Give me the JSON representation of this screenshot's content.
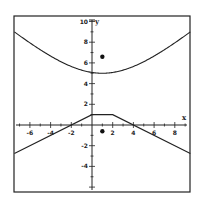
{
  "chart_data": {
    "type": "line",
    "title": "",
    "xlabel": "x",
    "ylabel": "y",
    "xlim": [
      -7.5,
      9.5
    ],
    "ylim": [
      -6.5,
      10.5
    ],
    "grid": false,
    "legend": null,
    "x_ticks": [
      -6,
      -4,
      -2,
      2,
      4,
      6,
      8
    ],
    "x_tick_labels": [
      "-6",
      "-4",
      "-2",
      "2",
      "4",
      "6",
      "8"
    ],
    "y_ticks": [
      10,
      8,
      6,
      4,
      2,
      -2,
      -4
    ],
    "y_tick_labels": [
      "10",
      "8",
      "6",
      "4",
      "2",
      "-2",
      "-4"
    ],
    "series": [
      {
        "name": "upper curve",
        "kind": "curve",
        "x": [
          -7.5,
          -6,
          -4,
          -2,
          0,
          1,
          2,
          4,
          6,
          8,
          9.5
        ],
        "y": [
          9.0,
          7.9,
          6.5,
          5.6,
          5.1,
          5.0,
          5.1,
          5.6,
          6.5,
          7.9,
          9.0
        ]
      },
      {
        "name": "lower piecewise",
        "kind": "polyline",
        "x": [
          -7.5,
          0,
          2,
          9.5
        ],
        "y": [
          -2.75,
          1,
          1,
          -2.75
        ]
      },
      {
        "name": "points",
        "kind": "scatter",
        "x": [
          1,
          1
        ],
        "y": [
          6.6,
          -0.6
        ]
      }
    ]
  },
  "axes": {
    "x_label": "x",
    "y_label": "y"
  }
}
